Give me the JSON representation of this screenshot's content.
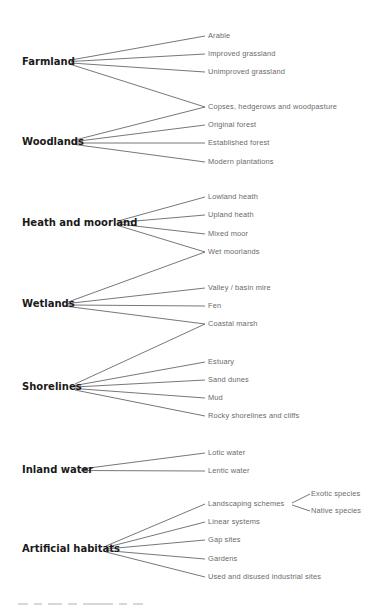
{
  "diagram": {
    "type": "habitat-classification-tree",
    "categories": [
      {
        "label": "Farmland",
        "x": 22,
        "y": 62,
        "anchor_x": 71,
        "children": [
          {
            "label": "Arable",
            "y": 36
          },
          {
            "label": "Improved grassland",
            "y": 54
          },
          {
            "label": "Unimproved grassland",
            "y": 72
          },
          {
            "label": "Copses, hedgerows and woodpasture",
            "y": 107,
            "shared": true
          }
        ]
      },
      {
        "label": "Woodlands",
        "x": 22,
        "y": 142,
        "anchor_x": 75,
        "children": [
          {
            "label": "Copses, hedgerows and woodpasture",
            "y": 107,
            "shared": true
          },
          {
            "label": "Original forest",
            "y": 125
          },
          {
            "label": "Established forest",
            "y": 143
          },
          {
            "label": "Modern plantations",
            "y": 162
          }
        ]
      },
      {
        "label": "Heath and moorland",
        "x": 22,
        "y": 223,
        "anchor_x": 118,
        "children": [
          {
            "label": "Lowland heath",
            "y": 197
          },
          {
            "label": "Upland heath",
            "y": 215
          },
          {
            "label": "Mixed moor",
            "y": 234
          },
          {
            "label": "Wet moorlands",
            "y": 252,
            "shared": true
          }
        ]
      },
      {
        "label": "Wetlands",
        "x": 22,
        "y": 304,
        "anchor_x": 68,
        "children": [
          {
            "label": "Wet moorlands",
            "y": 252,
            "shared": true
          },
          {
            "label": "Valley / basin mire",
            "y": 288
          },
          {
            "label": "Fen",
            "y": 306
          },
          {
            "label": "Coastal marsh",
            "y": 324,
            "shared": true
          }
        ]
      },
      {
        "label": "Shorelines",
        "x": 22,
        "y": 387,
        "anchor_x": 75,
        "children": [
          {
            "label": "Coastal marsh",
            "y": 324,
            "shared": true
          },
          {
            "label": "Estuary",
            "y": 362
          },
          {
            "label": "Sand dunes",
            "y": 380
          },
          {
            "label": "Mud",
            "y": 398
          },
          {
            "label": "Rocky shorelines and cliffs",
            "y": 416
          }
        ]
      },
      {
        "label": "Inland water",
        "x": 22,
        "y": 470,
        "anchor_x": 81,
        "children": [
          {
            "label": "Lotic water",
            "y": 453
          },
          {
            "label": "Lentic water",
            "y": 471
          }
        ]
      },
      {
        "label": "Artificial habitats",
        "x": 22,
        "y": 549,
        "anchor_x": 106,
        "children": [
          {
            "label": "Landscaping schemes",
            "y": 504,
            "children": [
              {
                "label": "Exotic species",
                "y": 494
              },
              {
                "label": "Native species",
                "y": 511
              }
            ]
          },
          {
            "label": "Linear systems",
            "y": 522
          },
          {
            "label": "Gap sites",
            "y": 540
          },
          {
            "label": "Gardens",
            "y": 559
          },
          {
            "label": "Used and disused industrial sites",
            "y": 577
          }
        ]
      }
    ],
    "leaf_line_end_x": 205,
    "leaf_text_x": 208,
    "sub_anchor_x": 292,
    "sub_line_end_x": 310,
    "sub_text_x": 311
  },
  "labels": {
    "farmland": "Farmland",
    "woodlands": "Woodlands",
    "heath": "Heath and moorland",
    "wetlands": "Wetlands",
    "shorelines": "Shorelines",
    "inland": "Inland water",
    "artificial": "Artificial habitats",
    "arable": "Arable",
    "improved": "Improved grassland",
    "unimproved": "Unimproved grassland",
    "copses": "Copses, hedgerows and woodpasture",
    "original": "Original forest",
    "established": "Established forest",
    "modern": "Modern plantations",
    "lowland": "Lowland heath",
    "upland": "Upland heath",
    "mixed": "Mixed moor",
    "wet": "Wet moorlands",
    "valley": "Valley / basin mire",
    "fen": "Fen",
    "coastal": "Coastal marsh",
    "estuary": "Estuary",
    "dunes": "Sand dunes",
    "mud": "Mud",
    "rocky": "Rocky shorelines and cliffs",
    "lotic": "Lotic water",
    "lentic": "Lentic water",
    "landscaping": "Landscaping schemes",
    "exotic": "Exotic species",
    "native": "Native species",
    "linear": "Linear systems",
    "gap": "Gap sites",
    "gardens": "Gardens",
    "industrial": "Used and disused industrial sites"
  }
}
